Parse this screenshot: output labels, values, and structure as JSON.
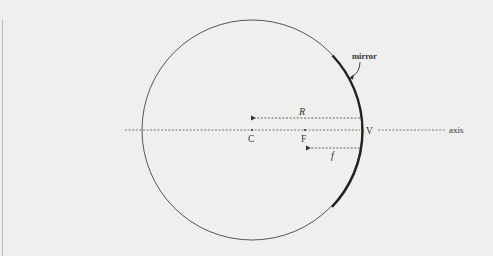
{
  "diagram": {
    "labels": {
      "mirror": "mirror",
      "radius": "R",
      "center": "C",
      "focal_point": "F",
      "vertex": "V",
      "focal_length": "f",
      "axis": "axis"
    },
    "colors": {
      "background": "#efefed",
      "circle": "#555555",
      "mirror_arc": "#222222",
      "dashed_lines": "#555555",
      "text": "#333333"
    },
    "geometry": {
      "circle_center": [
        252,
        130
      ],
      "circle_radius": 110,
      "axis_y": 130,
      "center_x": 252,
      "focal_x": 305,
      "vertex_x": 362
    }
  }
}
